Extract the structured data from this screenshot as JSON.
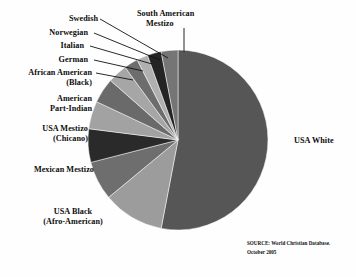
{
  "chart_data": {
    "type": "pie",
    "title": "",
    "subtitle": "",
    "xlabel": "",
    "ylabel": "",
    "legend_position": "callout-labels",
    "grid": false,
    "units": "percent",
    "center": {
      "x": 178,
      "y": 140
    },
    "radius": 90,
    "start_angle_deg": 0,
    "direction": "clockwise",
    "categories": [
      "USA White",
      "USA Black (Afro-American)",
      "Mexican Mestizo",
      "USA Mestizo (Chicano)",
      "American Part-Indian",
      "African American (Black)",
      "German",
      "Italian",
      "Norwegian",
      "Swedish",
      "South American Mestizo"
    ],
    "values": [
      53,
      11,
      7,
      6,
      5,
      4.5,
      3.5,
      2.5,
      2,
      2.5,
      3
    ],
    "colors": [
      "#565656",
      "#9c9c9c",
      "#6e6e6e",
      "#2a2a2a",
      "#a2a2a2",
      "#6a6a6a",
      "#a6a6a6",
      "#6d6d6d",
      "#b0b0b0",
      "#242424",
      "#757575"
    ],
    "slices": [
      {
        "label": "USA White",
        "value": 53,
        "color": "#565656"
      },
      {
        "label": "USA Black (Afro-American)",
        "value": 11,
        "color": "#9c9c9c"
      },
      {
        "label": "Mexican Mestizo",
        "value": 7,
        "color": "#6e6e6e"
      },
      {
        "label": "USA Mestizo (Chicano)",
        "value": 6,
        "color": "#2a2a2a"
      },
      {
        "label": "American Part-Indian",
        "value": 5,
        "color": "#a2a2a2"
      },
      {
        "label": "African American (Black)",
        "value": 4.5,
        "color": "#6a6a6a"
      },
      {
        "label": "German",
        "value": 3.5,
        "color": "#a6a6a6"
      },
      {
        "label": "Italian",
        "value": 2.5,
        "color": "#6d6d6d"
      },
      {
        "label": "Norwegian",
        "value": 2,
        "color": "#b0b0b0"
      },
      {
        "label": "Swedish",
        "value": 2.5,
        "color": "#242424"
      },
      {
        "label": "South American Mestizo",
        "value": 3,
        "color": "#757575"
      }
    ]
  },
  "labels": {
    "usa_white": "USA White",
    "usa_black_line1": "USA Black",
    "usa_black_line2": "(Afro-American)",
    "mexican_mestizo": "Mexican Mestizo",
    "usa_mestizo_line1": "USA Mestizo",
    "usa_mestizo_line2": "(Chicano)",
    "american_part_indian_line1": "American",
    "american_part_indian_line2": "Part-Indian",
    "african_american_line1": "African American",
    "african_american_line2": "(Black)",
    "german": "German",
    "italian": "Italian",
    "norwegian": "Norwegian",
    "swedish": "Swedish",
    "south_american_mestizo_line1": "South American",
    "south_american_mestizo_line2": "Mestizo"
  },
  "source": {
    "line1": "SOURCE: World Christian Database.",
    "line2": "October 2005"
  }
}
